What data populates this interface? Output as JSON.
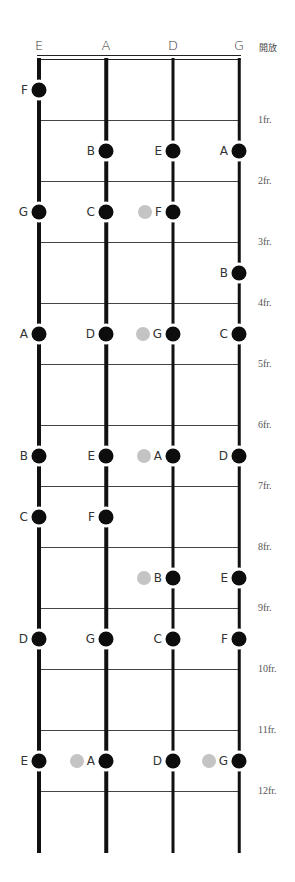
{
  "header": {
    "strings": [
      "E",
      "A",
      "D",
      "G"
    ],
    "open_label": "開放"
  },
  "frets": [
    "1fr.",
    "2fr.",
    "3fr.",
    "4fr.",
    "5fr.",
    "6fr.",
    "7fr.",
    "8fr.",
    "9fr.",
    "10fr.",
    "11fr.",
    "12fr."
  ],
  "colors": {
    "dot": "#0d0d0d",
    "ghost_dot": "#c4c4c4",
    "string": "#111111",
    "fret": "#444444"
  },
  "notes": [
    {
      "fret": 1,
      "string": 0,
      "label": "F"
    },
    {
      "fret": 2,
      "string": 1,
      "label": "B"
    },
    {
      "fret": 2,
      "string": 2,
      "label": "E"
    },
    {
      "fret": 2,
      "string": 3,
      "label": "A"
    },
    {
      "fret": 3,
      "string": 0,
      "label": "G"
    },
    {
      "fret": 3,
      "string": 1,
      "label": "C"
    },
    {
      "fret": 3,
      "string": 2,
      "label": "F",
      "ghost": true
    },
    {
      "fret": 4,
      "string": 3,
      "label": "B"
    },
    {
      "fret": 5,
      "string": 0,
      "label": "A"
    },
    {
      "fret": 5,
      "string": 1,
      "label": "D"
    },
    {
      "fret": 5,
      "string": 2,
      "label": "G",
      "ghost": true
    },
    {
      "fret": 5,
      "string": 3,
      "label": "C"
    },
    {
      "fret": 7,
      "string": 0,
      "label": "B"
    },
    {
      "fret": 7,
      "string": 1,
      "label": "E"
    },
    {
      "fret": 7,
      "string": 2,
      "label": "A",
      "ghost": true
    },
    {
      "fret": 7,
      "string": 3,
      "label": "D"
    },
    {
      "fret": 8,
      "string": 0,
      "label": "C"
    },
    {
      "fret": 8,
      "string": 1,
      "label": "F"
    },
    {
      "fret": 9,
      "string": 2,
      "label": "B",
      "ghost": true
    },
    {
      "fret": 9,
      "string": 3,
      "label": "E"
    },
    {
      "fret": 10,
      "string": 0,
      "label": "D"
    },
    {
      "fret": 10,
      "string": 1,
      "label": "G"
    },
    {
      "fret": 10,
      "string": 2,
      "label": "C"
    },
    {
      "fret": 10,
      "string": 3,
      "label": "F"
    },
    {
      "fret": 12,
      "string": 0,
      "label": "E"
    },
    {
      "fret": 12,
      "string": 1,
      "label": "A",
      "ghost": true
    },
    {
      "fret": 12,
      "string": 2,
      "label": "D"
    },
    {
      "fret": 12,
      "string": 3,
      "label": "G",
      "ghost": true
    }
  ]
}
